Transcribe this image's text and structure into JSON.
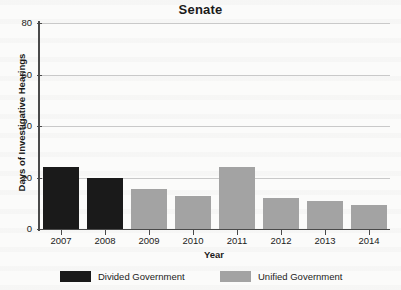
{
  "chart_data": {
    "type": "bar",
    "title": "Senate",
    "xlabel": "Year",
    "ylabel": "Days of Investigative Hearings",
    "categories": [
      "2007",
      "2008",
      "2009",
      "2010",
      "2011",
      "2012",
      "2013",
      "2014"
    ],
    "values": [
      24,
      20,
      15.5,
      13,
      24,
      12,
      11,
      9.5
    ],
    "groups": [
      "Divided Government",
      "Divided Government",
      "Unified Government",
      "Unified Government",
      "Unified Government",
      "Unified Government",
      "Unified Government",
      "Unified Government"
    ],
    "ylim": [
      0,
      80
    ],
    "yticks": [
      0,
      20,
      40,
      60,
      80
    ],
    "ytick_labels": [
      "0",
      "20",
      "40",
      "60",
      "80"
    ],
    "grid": true,
    "legend_position": "bottom",
    "series": [
      {
        "name": "Divided Government",
        "color": "#1a1a1a"
      },
      {
        "name": "Unified Government",
        "color": "#a3a3a3"
      }
    ]
  },
  "legend": {
    "items": [
      {
        "label": "Divided Government",
        "color": "#1a1a1a"
      },
      {
        "label": "Unified Government",
        "color": "#a3a3a3"
      }
    ]
  },
  "colors": {
    "divided": "#1a1a1a",
    "unified": "#a3a3a3",
    "grid": "#c9c9c9",
    "axis": "#4a4a4a",
    "text": "#1b1b1b",
    "background": "#fbfbfa"
  }
}
